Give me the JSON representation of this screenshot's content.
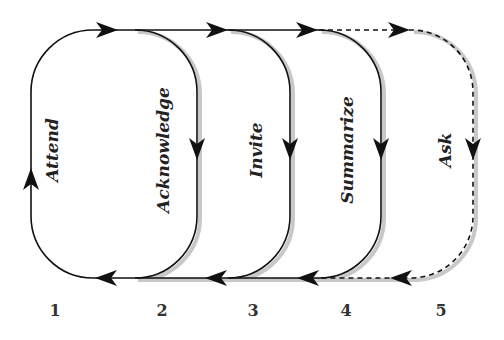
{
  "diagram": {
    "type": "cyclic-process",
    "steps": [
      {
        "number": "1",
        "label": "Attend",
        "style": "solid"
      },
      {
        "number": "2",
        "label": "Acknowledge",
        "style": "solid"
      },
      {
        "number": "3",
        "label": "Invite",
        "style": "solid"
      },
      {
        "number": "4",
        "label": "Summarize",
        "style": "solid"
      },
      {
        "number": "5",
        "label": "Ask",
        "style": "dashed"
      }
    ],
    "colors": {
      "line": "#111111",
      "shadow": "#c8c8c8",
      "text": "#222222"
    }
  }
}
